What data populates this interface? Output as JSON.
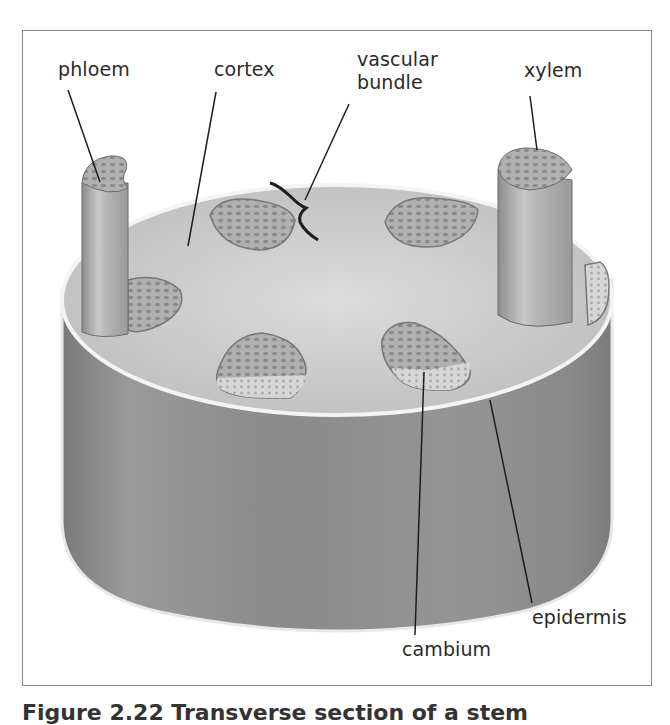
{
  "figure": {
    "caption": "Figure 2.22 Transverse section of a stem",
    "labels": {
      "phloem": "phloem",
      "cortex": "cortex",
      "vascular_bundle_line1": "vascular",
      "vascular_bundle_line2": "bundle",
      "xylem": "xylem",
      "cambium": "cambium",
      "epidermis": "epidermis"
    },
    "colors": {
      "cylinder_side": "#8c8c8c",
      "cylinder_top": "#c9c9c9",
      "bundle_fill": "#a8a8a8",
      "rim": "#f2f2f2",
      "leader_line": "#1e1e1e",
      "frame": "#8a8a8a"
    }
  }
}
